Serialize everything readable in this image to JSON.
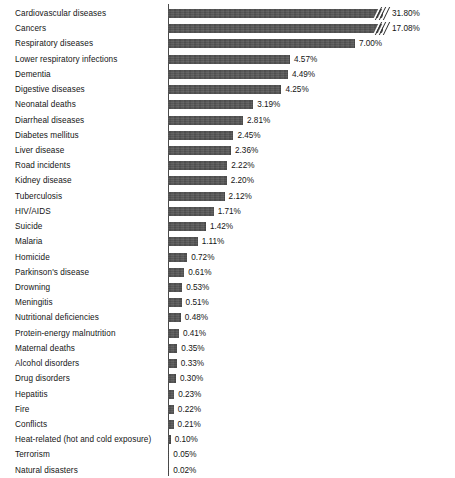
{
  "chart_data": {
    "type": "bar",
    "orientation": "horizontal",
    "title": "",
    "subtitle": "",
    "xlabel": "",
    "ylabel": "",
    "grid": false,
    "legend": null,
    "axis_break": {
      "present": true,
      "applies_to": [
        "Cardiovascular diseases",
        "Cancers"
      ],
      "note": "Top two bars truncated with diagonal break marks"
    },
    "value_suffix": "%",
    "xlim": [
      0,
      7.4
    ],
    "categories": [
      "Cardiovascular diseases",
      "Cancers",
      "Respiratory diseases",
      "Lower respiratory infections",
      "Dementia",
      "Digestive diseases",
      "Neonatal deaths",
      "Diarrheal diseases",
      "Diabetes mellitus",
      "Liver disease",
      "Road incidents",
      "Kidney disease",
      "Tuberculosis",
      "HIV/AIDS",
      "Suicide",
      "Malaria",
      "Homicide",
      "Parkinson's disease",
      "Drowning",
      "Meningitis",
      "Nutritional deficiencies",
      "Protein-energy malnutrition",
      "Maternal deaths",
      "Alcohol disorders",
      "Drug disorders",
      "Hepatitis",
      "Fire",
      "Conflicts",
      "Heat-related (hot and cold exposure)",
      "Terrorism",
      "Natural disasters"
    ],
    "values": [
      31.8,
      17.08,
      7.0,
      4.57,
      4.49,
      4.25,
      3.19,
      2.81,
      2.45,
      2.36,
      2.22,
      2.2,
      2.12,
      1.71,
      1.42,
      1.11,
      0.72,
      0.61,
      0.53,
      0.51,
      0.48,
      0.41,
      0.35,
      0.33,
      0.3,
      0.23,
      0.22,
      0.21,
      0.1,
      0.05,
      0.02
    ],
    "value_labels": [
      "31.80%",
      "17.08%",
      "7.00%",
      "4.57%",
      "4.49%",
      "4.25%",
      "3.19%",
      "2.81%",
      "2.45%",
      "2.36%",
      "2.22%",
      "2.20%",
      "2.12%",
      "1.71%",
      "1.42%",
      "1.11%",
      "0.72%",
      "0.61%",
      "0.53%",
      "0.51%",
      "0.48%",
      "0.41%",
      "0.35%",
      "0.33%",
      "0.30%",
      "0.23%",
      "0.22%",
      "0.21%",
      "0.10%",
      "0.05%",
      "0.02%"
    ],
    "colors": {
      "bar": "#555555",
      "axis": "#4a4a4a",
      "text": "#141414",
      "background": "#ffffff"
    }
  }
}
